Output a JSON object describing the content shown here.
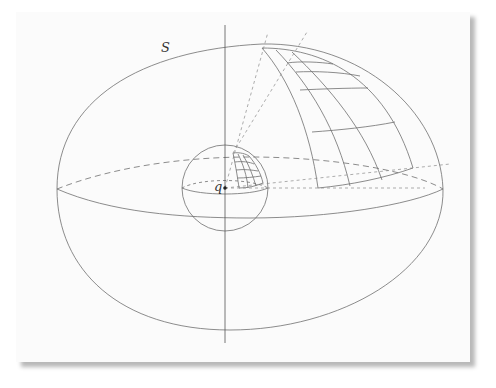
{
  "figure": {
    "labels": {
      "surface": "S",
      "point": "q"
    },
    "colors": {
      "stroke": "#6e6e6e",
      "axis": "#555555",
      "dashed": "#8a8a8a",
      "card": "#fbfbfb"
    }
  }
}
